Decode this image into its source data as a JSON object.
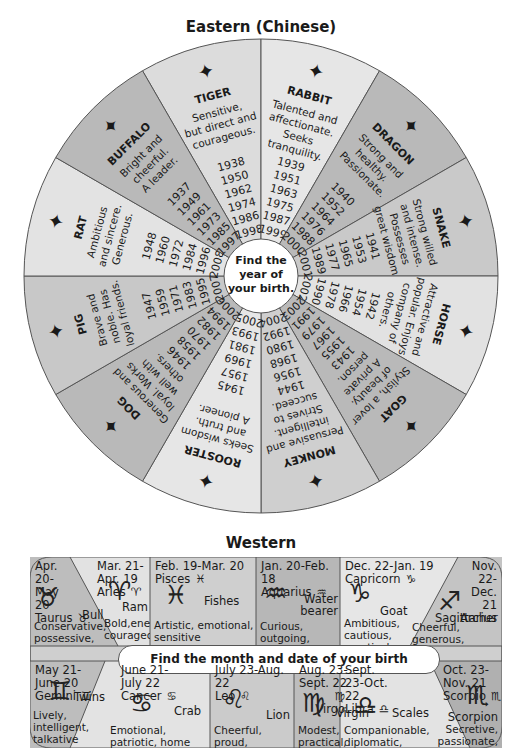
{
  "eastern": {
    "title": "Eastern (Chinese)",
    "center_text": [
      "Find the",
      "year of",
      "your birth."
    ],
    "signs": [
      {
        "name": "TIGER",
        "traits": [
          "Sensitive,",
          "but direct and",
          "courageous."
        ],
        "years": [
          "1938",
          "1950",
          "1962",
          "1974",
          "1986",
          "1998"
        ],
        "icon": "tiger-icon"
      },
      {
        "name": "RABBIT",
        "traits": [
          "Talented and",
          "affectionate.",
          "Seeks",
          "tranquility."
        ],
        "years": [
          "1939",
          "1951",
          "1963",
          "1975",
          "1987",
          "1999"
        ],
        "icon": "rabbit-icon"
      },
      {
        "name": "DRAGON",
        "traits": [
          "Strong and",
          "healthy.",
          "Passionate."
        ],
        "years": [
          "1940",
          "1952",
          "1964",
          "1976",
          "1988",
          "2000"
        ],
        "icon": "dragon-icon"
      },
      {
        "name": "SNAKE",
        "traits": [
          "Strong willed",
          "and intense.",
          "Possesses",
          "great wisdom."
        ],
        "years": [
          "1941",
          "1953",
          "1965",
          "1977",
          "1989",
          "2001"
        ],
        "icon": "snake-icon"
      },
      {
        "name": "HORSE",
        "traits": [
          "Attractive and",
          "popular. Enjoys",
          "company of",
          "others."
        ],
        "years": [
          "1942",
          "1954",
          "1966",
          "1978",
          "1990",
          "2002"
        ],
        "icon": "horse-icon"
      },
      {
        "name": "GOAT",
        "traits": [
          "Stylish, a lover",
          "of beauty.",
          "A private",
          "person."
        ],
        "years": [
          "1943",
          "1955",
          "1967",
          "1979",
          "1991",
          "2003"
        ],
        "icon": "goat-icon"
      },
      {
        "name": "MONKEY",
        "traits": [
          "Persuasive and",
          "intelligent.",
          "Strives to",
          "succeed."
        ],
        "years": [
          "1944",
          "1956",
          "1968",
          "1980",
          "1992",
          "2004"
        ],
        "icon": "monkey-icon"
      },
      {
        "name": "ROOSTER",
        "traits": [
          "Seeks wisdom",
          "and truth.",
          "A pioneer."
        ],
        "years": [
          "1945",
          "1957",
          "1969",
          "1981",
          "1993",
          "2005"
        ],
        "icon": "rooster-icon"
      },
      {
        "name": "DOG",
        "traits": [
          "Generous and",
          "loyal. Works",
          "well with",
          "others."
        ],
        "years": [
          "1946",
          "1958",
          "1970",
          "1982",
          "1994",
          "2006"
        ],
        "icon": "dog-icon"
      },
      {
        "name": "PIG",
        "traits": [
          "Brave and",
          "noble. Has",
          "loyal friends."
        ],
        "years": [
          "1947",
          "1959",
          "1971",
          "1983",
          "1995",
          "2007"
        ],
        "icon": "pig-icon"
      },
      {
        "name": "RAT",
        "traits": [
          "Ambitious",
          "and sincere.",
          "Generous."
        ],
        "years": [
          "1948",
          "1960",
          "1972",
          "1984",
          "1996",
          "2008"
        ],
        "icon": "rat-icon"
      },
      {
        "name": "BUFFALO",
        "traits": [
          "Bright and",
          "cheerful.",
          "A leader."
        ],
        "years": [
          "1937",
          "1949",
          "1961",
          "1973",
          "1985",
          "1997"
        ],
        "icon": "buffalo-icon"
      }
    ]
  },
  "western": {
    "title": "Western",
    "center_text": "Find the month and date of your birth",
    "signs": [
      {
        "date": "Apr. 20-May 20",
        "name": "Taurus",
        "symbol": "♉",
        "animal": "Bull",
        "traits": "Conservative, possessive, loyal"
      },
      {
        "date": "Mar. 21-Apr. 19",
        "name": "Aries",
        "symbol": "♈",
        "animal": "Ram",
        "traits": "Bold,energetic courageous"
      },
      {
        "date": "Feb. 19-Mar. 20",
        "name": "Pisces",
        "symbol": "♓",
        "animal": "Fishes",
        "traits": "Artistic, emotional, sensitive"
      },
      {
        "date": "Jan. 20-Feb. 18",
        "name": "Aquarius",
        "symbol": "♒",
        "animal": "Water bearer",
        "traits": "Curious, outgoing, independent"
      },
      {
        "date": "Dec. 22-Jan. 19",
        "name": "Capricorn",
        "symbol": "♑",
        "animal": "Goat",
        "traits": "Ambitious, cautious, practical"
      },
      {
        "date": "Nov. 22-Dec. 21",
        "name": "Sagittarius",
        "symbol": "♐",
        "animal": "Archer",
        "traits": "Cheerful, generous, restless"
      },
      {
        "date": "May 21-June 20",
        "name": "Gemini",
        "symbol": "♊",
        "animal": "Twins",
        "traits": "Lively, intelligent, talkative"
      },
      {
        "date": "June 21-July 22",
        "name": "Cancer",
        "symbol": "♋",
        "animal": "Crab",
        "traits": "Emotional, patriotic, home loving"
      },
      {
        "date": "July 23-Aug. 22",
        "name": "Leo",
        "symbol": "♌",
        "animal": "Lion",
        "traits": "Cheerful, proud, powerful"
      },
      {
        "date": "Aug. 23-Sept. 22",
        "name": "Virgo",
        "symbol": "♍",
        "animal": "Virgin",
        "traits": "Modest, practical, tidy"
      },
      {
        "date": "Sept. 23-Oct. 22",
        "name": "Libra",
        "symbol": "♎",
        "animal": "Scales",
        "traits": "Companionable, diplomatic, pleasant"
      },
      {
        "date": "Oct. 23-Nov. 21",
        "name": "Scorpio",
        "symbol": "♏",
        "animal": "Scorpion",
        "traits": "Secretive, passionate, intense"
      }
    ]
  },
  "colors": {
    "dark": "#b9b9b9",
    "light": "#dcdcdc",
    "line": "#555555"
  }
}
